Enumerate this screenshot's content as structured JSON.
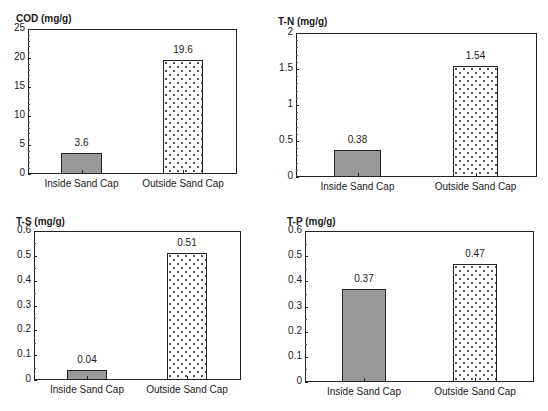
{
  "chart_data": [
    {
      "type": "bar",
      "title": "COD (mg/g)",
      "xlabel": "",
      "ylabel": "COD (mg/g)",
      "categories": [
        "Inside Sand Cap",
        "Outside Sand Cap"
      ],
      "values": [
        3.6,
        19.6
      ],
      "value_labels": [
        "3.6",
        "19.6"
      ],
      "ylim": [
        0,
        25
      ],
      "yticks": [
        "0",
        "5",
        "10",
        "15",
        "20",
        "25"
      ],
      "grid": false,
      "legend": null,
      "bar_styles": [
        "solid-gray",
        "dotted-hatch"
      ]
    },
    {
      "type": "bar",
      "title": "T-N (mg/g)",
      "xlabel": "",
      "ylabel": "T-N (mg/g)",
      "categories": [
        "Inside Sand Cap",
        "Outside Sand Cap"
      ],
      "values": [
        0.38,
        1.54
      ],
      "value_labels": [
        "0.38",
        "1.54"
      ],
      "ylim": [
        0,
        2
      ],
      "yticks": [
        "0",
        "0.5",
        "1",
        "1.5",
        "2"
      ],
      "grid": false,
      "legend": null,
      "bar_styles": [
        "solid-gray",
        "dotted-hatch"
      ]
    },
    {
      "type": "bar",
      "title": "T-S (mg/g)",
      "xlabel": "",
      "ylabel": "T-S (mg/g)",
      "categories": [
        "Inside Sand Cap",
        "Outside Sand Cap"
      ],
      "values": [
        0.04,
        0.51
      ],
      "value_labels": [
        "0.04",
        "0.51"
      ],
      "ylim": [
        0,
        0.6
      ],
      "yticks": [
        "0",
        "0.1",
        "0.2",
        "0.3",
        "0.4",
        "0.5",
        "0.6"
      ],
      "grid": false,
      "legend": null,
      "bar_styles": [
        "solid-gray",
        "dotted-hatch"
      ]
    },
    {
      "type": "bar",
      "title": "T-P (mg/g)",
      "xlabel": "",
      "ylabel": "T-P (mg/g)",
      "categories": [
        "Inside Sand Cap",
        "Outside Sand Cap"
      ],
      "values": [
        0.37,
        0.47
      ],
      "value_labels": [
        "0.37",
        "0.47"
      ],
      "ylim": [
        0,
        0.6
      ],
      "yticks": [
        "0",
        "0.1",
        "0.2",
        "0.3",
        "0.4",
        "0.5",
        "0.6"
      ],
      "grid": false,
      "legend": null,
      "bar_styles": [
        "solid-gray",
        "dotted-hatch"
      ]
    }
  ],
  "colors": {
    "solid_bar": "#9a9a9a",
    "frame": "#222222",
    "hatch_dot": "#555555"
  }
}
